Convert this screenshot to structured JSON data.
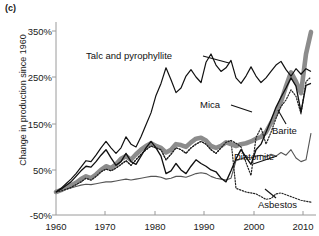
{
  "panel": {
    "label": "(c)"
  },
  "axes": {
    "ylabel": "Change in production since 1960",
    "yticks": [
      "350%",
      "250%",
      "150%",
      "50%",
      "-50%"
    ],
    "xticks": [
      "1960",
      "1970",
      "1980",
      "1990",
      "2000",
      "2010"
    ]
  },
  "annotations": {
    "talc": "Talc and  pyrophyllite",
    "mica": "Mica",
    "barite": "Barite",
    "diatomite": "Diatomite",
    "asbestos": "Asbestos"
  },
  "colors": {
    "talc": "#8c8c8c",
    "mica": "#111111",
    "barite": "#111111",
    "diatomite": "#555555",
    "asbestos": "#222222",
    "axis": "#9a9a9a",
    "text": "#111111"
  },
  "chart_data": {
    "type": "line",
    "title": "",
    "xlabel": "",
    "ylabel": "Change in production since 1960",
    "xlim": [
      1960,
      2012
    ],
    "ylim": [
      -50,
      380
    ],
    "grid": false,
    "legend": "inline-annotations",
    "x": [
      1960,
      1961,
      1962,
      1963,
      1964,
      1965,
      1966,
      1967,
      1968,
      1969,
      1970,
      1971,
      1972,
      1973,
      1974,
      1975,
      1976,
      1977,
      1978,
      1979,
      1980,
      1981,
      1982,
      1983,
      1984,
      1985,
      1986,
      1987,
      1988,
      1989,
      1990,
      1991,
      1992,
      1993,
      1994,
      1995,
      1996,
      1997,
      1998,
      1999,
      2000,
      2001,
      2002,
      2003,
      2004,
      2005,
      2006,
      2007,
      2008,
      2009,
      2010,
      2011
    ],
    "series": [
      {
        "name": "Talc and  pyrophyllite",
        "style": "thick-gray",
        "color": "#8c8c8c",
        "values": [
          0,
          4,
          10,
          14,
          20,
          28,
          34,
          30,
          38,
          48,
          56,
          52,
          60,
          72,
          78,
          70,
          82,
          92,
          100,
          106,
          100,
          96,
          86,
          92,
          104,
          102,
          98,
          108,
          116,
          118,
          112,
          100,
          96,
          100,
          108,
          104,
          100,
          104,
          106,
          110,
          116,
          120,
          130,
          150,
          170,
          196,
          230,
          260,
          240,
          215,
          300,
          348
        ]
      },
      {
        "name": "Barite",
        "style": "thin-black",
        "color": "#111111",
        "values": [
          0,
          6,
          14,
          22,
          34,
          46,
          56,
          54,
          66,
          80,
          92,
          74,
          58,
          66,
          84,
          66,
          60,
          78,
          96,
          110,
          96,
          78,
          40,
          46,
          62,
          48,
          40,
          56,
          70,
          62,
          56,
          48,
          44,
          30,
          22,
          46,
          72,
          92,
          76,
          60,
          92,
          104,
          130,
          156,
          184,
          206,
          226,
          248,
          230,
          174,
          232,
          236
        ]
      },
      {
        "name": "Mica",
        "style": "dotted-black",
        "color": "#222222",
        "values": [
          0,
          2,
          6,
          10,
          16,
          22,
          30,
          26,
          34,
          44,
          50,
          46,
          52,
          60,
          68,
          58,
          70,
          82,
          92,
          100,
          96,
          92,
          70,
          82,
          96,
          92,
          84,
          96,
          104,
          110,
          104,
          92,
          84,
          96,
          108,
          112,
          106,
          98,
          64,
          36,
          118,
          140,
          104,
          130,
          160,
          186,
          200,
          222,
          208,
          170,
          240,
          250
        ]
      },
      {
        "name": "Unlabeled black (upper)",
        "style": "thin-black",
        "color": "#111111",
        "values": [
          0,
          8,
          18,
          28,
          40,
          54,
          68,
          66,
          80,
          96,
          110,
          96,
          84,
          96,
          120,
          104,
          98,
          120,
          146,
          172,
          210,
          236,
          270,
          244,
          216,
          226,
          252,
          266,
          250,
          238,
          282,
          300,
          276,
          262,
          270,
          286,
          248,
          236,
          252,
          272,
          252,
          238,
          248,
          262,
          276,
          284,
          266,
          252,
          268,
          256,
          268,
          262
        ]
      },
      {
        "name": "Diatomite",
        "style": "thin-gray",
        "color": "#555555",
        "values": [
          0,
          3,
          6,
          9,
          12,
          15,
          17,
          16,
          18,
          20,
          22,
          22,
          24,
          26,
          28,
          26,
          28,
          30,
          32,
          34,
          34,
          32,
          28,
          30,
          34,
          34,
          32,
          36,
          40,
          42,
          40,
          34,
          30,
          28,
          26,
          30,
          68,
          72,
          76,
          74,
          78,
          80,
          76,
          82,
          78,
          86,
          80,
          92,
          74,
          66,
          70,
          128
        ]
      },
      {
        "name": "Asbestos",
        "style": "dotted-black",
        "color": "#222222",
        "values": [
          0,
          2,
          6,
          10,
          16,
          22,
          30,
          26,
          34,
          44,
          50,
          46,
          52,
          60,
          68,
          58,
          70,
          82,
          92,
          100,
          96,
          92,
          70,
          82,
          96,
          92,
          84,
          96,
          104,
          110,
          104,
          92,
          84,
          96,
          108,
          112,
          8,
          4,
          0,
          -2,
          -4,
          -10,
          -16,
          -14,
          -4,
          -2,
          -6,
          -10,
          -14,
          -18,
          -20,
          -22
        ]
      }
    ]
  }
}
